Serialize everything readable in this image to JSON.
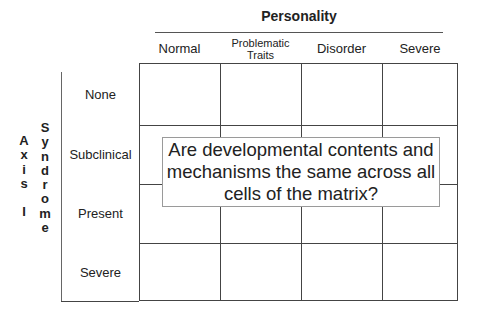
{
  "diagram": {
    "column_group_title": "Personality",
    "columns": [
      {
        "label": "Normal"
      },
      {
        "label_line1": "Problematic",
        "label_line2": "Traits"
      },
      {
        "label": "Disorder"
      },
      {
        "label": "Severe"
      }
    ],
    "row_group_title_outer": [
      "A",
      "x",
      "i",
      "s",
      "",
      "I"
    ],
    "row_group_title_inner": [
      "S",
      "y",
      "n",
      "d",
      "r",
      "o",
      "m",
      "e"
    ],
    "rows": [
      {
        "label": "None"
      },
      {
        "label": "Subclinical"
      },
      {
        "label": "Present"
      },
      {
        "label": "Severe"
      }
    ],
    "overlay_text": {
      "line1": "Are developmental contents and",
      "line2": "mechanisms the same across all",
      "line3": "cells of the matrix?"
    },
    "colors": {
      "grid_line": "#444444",
      "overlay_border": "#9a9a9a",
      "text": "#222222",
      "background": "#ffffff"
    }
  }
}
